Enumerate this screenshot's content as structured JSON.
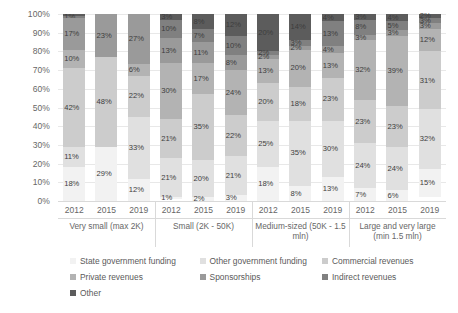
{
  "chart_data": {
    "type": "bar",
    "subtype": "stacked-percentage-bar",
    "title": "",
    "xlabel": "",
    "ylabel": "",
    "ylim": [
      0,
      100
    ],
    "y_ticks": [
      "0%",
      "10%",
      "20%",
      "30%",
      "40%",
      "50%",
      "60%",
      "70%",
      "80%",
      "90%",
      "100%"
    ],
    "grid": true,
    "legend_position": "bottom",
    "x_groups": [
      {
        "name": "Very small (max 2K)",
        "years": [
          "2012",
          "2015",
          "2019"
        ]
      },
      {
        "name": "Small (2K - 50K)",
        "years": [
          "2012",
          "2015",
          "2019"
        ]
      },
      {
        "name": "Medium-sized (50K - 1.5 mln)",
        "years": [
          "2012",
          "2015",
          "2019"
        ]
      },
      {
        "name": "Large and very large (min 1.5 mln)",
        "years": [
          "2012",
          "2015",
          "2019"
        ]
      }
    ],
    "series": [
      {
        "name": "State government funding",
        "color": "#f2f2f2"
      },
      {
        "name": "Other government funding",
        "color": "#e0e0e0"
      },
      {
        "name": "Commercial revenues",
        "color": "#cccccc"
      },
      {
        "name": "Private revenues",
        "color": "#b3b3b3"
      },
      {
        "name": "Sponsorships",
        "color": "#9a9a9a"
      },
      {
        "name": "Indirect revenues",
        "color": "#808080"
      },
      {
        "name": "Other",
        "color": "#5c5c5c"
      }
    ],
    "bars": [
      {
        "group": "Very small (max 2K)",
        "year": "2012",
        "segments": [
          {
            "series": "State government funding",
            "value": 18,
            "label": "18%"
          },
          {
            "series": "Other government funding",
            "value": 11,
            "label": "11%"
          },
          {
            "series": "Commercial revenues",
            "value": 42,
            "label": "42%"
          },
          {
            "series": "Private revenues",
            "value": 10,
            "label": "10%"
          },
          {
            "series": "Sponsorships",
            "value": 17,
            "label": "17%"
          },
          {
            "series": "Indirect revenues",
            "value": 1,
            "label": "1%"
          },
          {
            "series": "Other",
            "value": 1,
            "label": ""
          }
        ]
      },
      {
        "group": "Very small (max 2K)",
        "year": "2015",
        "segments": [
          {
            "series": "State government funding",
            "value": 29,
            "label": "29%"
          },
          {
            "series": "Other government funding",
            "value": 0,
            "label": ""
          },
          {
            "series": "Commercial revenues",
            "value": 48,
            "label": "48%"
          },
          {
            "series": "Private revenues",
            "value": 0,
            "label": ""
          },
          {
            "series": "Sponsorships",
            "value": 23,
            "label": "23%"
          },
          {
            "series": "Indirect revenues",
            "value": 0,
            "label": ""
          },
          {
            "series": "Other",
            "value": 0,
            "label": ""
          }
        ]
      },
      {
        "group": "Very small (max 2K)",
        "year": "2019",
        "segments": [
          {
            "series": "State government funding",
            "value": 12,
            "label": "12%"
          },
          {
            "series": "Other government funding",
            "value": 33,
            "label": "33%"
          },
          {
            "series": "Commercial revenues",
            "value": 22,
            "label": "22%"
          },
          {
            "series": "Private revenues",
            "value": 6,
            "label": "6%"
          },
          {
            "series": "Sponsorships",
            "value": 27,
            "label": "27%"
          },
          {
            "series": "Indirect revenues",
            "value": 0,
            "label": ""
          },
          {
            "series": "Other",
            "value": 0,
            "label": ""
          }
        ]
      },
      {
        "group": "Small (2K - 50K)",
        "year": "2012",
        "segments": [
          {
            "series": "State government funding",
            "value": 1,
            "label": "1%"
          },
          {
            "series": "Other government funding",
            "value": 21,
            "label": "21%"
          },
          {
            "series": "Commercial revenues",
            "value": 21,
            "label": "21%"
          },
          {
            "series": "Private revenues",
            "value": 30,
            "label": "30%"
          },
          {
            "series": "Sponsorships",
            "value": 13,
            "label": "13%"
          },
          {
            "series": "Indirect revenues",
            "value": 10,
            "label": "10%"
          },
          {
            "series": "Other",
            "value": 3,
            "label": "3%"
          }
        ]
      },
      {
        "group": "Small (2K - 50K)",
        "year": "2015",
        "segments": [
          {
            "series": "State government funding",
            "value": 2,
            "label": "2%"
          },
          {
            "series": "Other government funding",
            "value": 20,
            "label": "20%"
          },
          {
            "series": "Commercial revenues",
            "value": 35,
            "label": "35%"
          },
          {
            "series": "Private revenues",
            "value": 17,
            "label": "17%"
          },
          {
            "series": "Sponsorships",
            "value": 11,
            "label": "11%"
          },
          {
            "series": "Indirect revenues",
            "value": 7,
            "label": "7%"
          },
          {
            "series": "Other",
            "value": 8,
            "label": "8%"
          }
        ]
      },
      {
        "group": "Small (2K - 50K)",
        "year": "2019",
        "segments": [
          {
            "series": "State government funding",
            "value": 3,
            "label": "3%"
          },
          {
            "series": "Other government funding",
            "value": 21,
            "label": "21%"
          },
          {
            "series": "Commercial revenues",
            "value": 22,
            "label": "22%"
          },
          {
            "series": "Private revenues",
            "value": 24,
            "label": "24%"
          },
          {
            "series": "Sponsorships",
            "value": 8,
            "label": "8%"
          },
          {
            "series": "Indirect revenues",
            "value": 10,
            "label": "10%"
          },
          {
            "series": "Other",
            "value": 12,
            "label": "12%"
          }
        ]
      },
      {
        "group": "Medium-sized (50K - 1.5 mln)",
        "year": "2012",
        "segments": [
          {
            "series": "State government funding",
            "value": 18,
            "label": "18%"
          },
          {
            "series": "Other government funding",
            "value": 25,
            "label": "25%"
          },
          {
            "series": "Commercial revenues",
            "value": 20,
            "label": "20%"
          },
          {
            "series": "Private revenues",
            "value": 13,
            "label": "13%"
          },
          {
            "series": "Sponsorships",
            "value": 2,
            "label": "2%"
          },
          {
            "series": "Indirect revenues",
            "value": 2,
            "label": "2%"
          },
          {
            "series": "Other",
            "value": 20,
            "label": "20%"
          }
        ]
      },
      {
        "group": "Medium-sized (50K - 1.5 mln)",
        "year": "2015",
        "segments": [
          {
            "series": "State government funding",
            "value": 8,
            "label": "8%"
          },
          {
            "series": "Other government funding",
            "value": 35,
            "label": "35%"
          },
          {
            "series": "Commercial revenues",
            "value": 18,
            "label": "18%"
          },
          {
            "series": "Private revenues",
            "value": 20,
            "label": "20%"
          },
          {
            "series": "Sponsorships",
            "value": 2,
            "label": "2%"
          },
          {
            "series": "Indirect revenues",
            "value": 3,
            "label": "3%"
          },
          {
            "series": "Other",
            "value": 14,
            "label": "14%"
          }
        ]
      },
      {
        "group": "Medium-sized (50K - 1.5 mln)",
        "year": "2019",
        "segments": [
          {
            "series": "State government funding",
            "value": 13,
            "label": "13%"
          },
          {
            "series": "Other government funding",
            "value": 30,
            "label": "30%"
          },
          {
            "series": "Commercial revenues",
            "value": 23,
            "label": "23%"
          },
          {
            "series": "Private revenues",
            "value": 13,
            "label": "13%"
          },
          {
            "series": "Sponsorships",
            "value": 4,
            "label": "4%"
          },
          {
            "series": "Indirect revenues",
            "value": 13,
            "label": "13%"
          },
          {
            "series": "Other",
            "value": 4,
            "label": "4%"
          }
        ]
      },
      {
        "group": "Large and very large (min 1.5 mln)",
        "year": "2012",
        "segments": [
          {
            "series": "State government funding",
            "value": 7,
            "label": "7%"
          },
          {
            "series": "Other government funding",
            "value": 24,
            "label": "24%"
          },
          {
            "series": "Commercial revenues",
            "value": 23,
            "label": "23%"
          },
          {
            "series": "Private revenues",
            "value": 32,
            "label": "32%"
          },
          {
            "series": "Sponsorships",
            "value": 3,
            "label": "3%"
          },
          {
            "series": "Indirect revenues",
            "value": 8,
            "label": "8%"
          },
          {
            "series": "Other",
            "value": 3,
            "label": "3%"
          }
        ]
      },
      {
        "group": "Large and very large (min 1.5 mln)",
        "year": "2015",
        "segments": [
          {
            "series": "State government funding",
            "value": 6,
            "label": "6%"
          },
          {
            "series": "Other government funding",
            "value": 24,
            "label": "24%"
          },
          {
            "series": "Commercial revenues",
            "value": 23,
            "label": "23%"
          },
          {
            "series": "Private revenues",
            "value": 39,
            "label": "39%"
          },
          {
            "series": "Sponsorships",
            "value": 3,
            "label": "3%"
          },
          {
            "series": "Indirect revenues",
            "value": 5,
            "label": "5%"
          },
          {
            "series": "Other",
            "value": 4,
            "label": "4%"
          }
        ]
      },
      {
        "group": "Large and very large (min 1.5 mln)",
        "year": "2019",
        "segments": [
          {
            "series": "State government funding",
            "value": 15,
            "label": "15%"
          },
          {
            "series": "Other government funding",
            "value": 32,
            "label": "32%"
          },
          {
            "series": "Commercial revenues",
            "value": 31,
            "label": "31%"
          },
          {
            "series": "Private revenues",
            "value": 12,
            "label": "12%"
          },
          {
            "series": "Sponsorships",
            "value": 3,
            "label": "3%"
          },
          {
            "series": "Indirect revenues",
            "value": 3,
            "label": "3%"
          },
          {
            "series": "Other",
            "value": 2,
            "label": "2%"
          }
        ]
      }
    ]
  }
}
